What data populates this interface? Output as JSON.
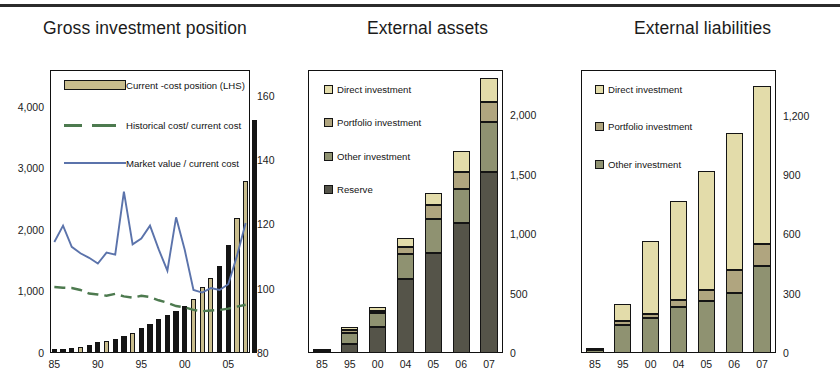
{
  "colors": {
    "direct_investment": "#e3dcaa",
    "portfolio_investment": "#b0a57f",
    "other_investment": "#8f9271",
    "reserve": "#555449",
    "bar_black": "#151515",
    "bar_tan": "#c9bd8d",
    "line_market": "#5b73ab",
    "line_historical": "#4d7a4f",
    "frame": "#111111"
  },
  "panels": [
    {
      "id": "gross-investment-position",
      "title": "Gross investment position"
    },
    {
      "id": "external-assets",
      "title": "External assets"
    },
    {
      "id": "external-liabilities",
      "title": "External liabilities"
    }
  ],
  "chart_data": [
    {
      "type": "bar",
      "id": "gross-investment-position",
      "title": "Gross investment position",
      "xlabel": "",
      "ylabel": "",
      "grid": false,
      "legend_position": "inside-top-left",
      "x": [
        1985,
        1986,
        1987,
        1988,
        1989,
        1990,
        1991,
        1992,
        1993,
        1994,
        1995,
        1996,
        1997,
        1998,
        1999,
        2000,
        2001,
        2002,
        2003,
        2004,
        2005,
        2006,
        2007
      ],
      "tick_labels": [
        "85",
        "90",
        "95",
        "00",
        "05"
      ],
      "tick_values": [
        1985,
        1990,
        1995,
        2000,
        2005
      ],
      "y_left_ticks": [
        "0",
        "1,000",
        "2,000",
        "3,000",
        "4,000"
      ],
      "y_left_tick_values": [
        0,
        1000,
        2000,
        3000,
        4000
      ],
      "ylim_left": [
        0,
        4600
      ],
      "y_right_ticks": [
        "80",
        "100",
        "120",
        "140",
        "160"
      ],
      "y_right_tick_values": [
        80,
        100,
        120,
        140,
        160
      ],
      "ylim_right": [
        80,
        168
      ],
      "series": [
        {
          "name": "Current -cost position (LHS)",
          "type": "bar",
          "axis": "left",
          "values": [
            60,
            70,
            85,
            100,
            130,
            175,
            200,
            235,
            280,
            330,
            400,
            470,
            545,
            620,
            690,
            760,
            870,
            1080,
            1220,
            1420,
            1750,
            2200,
            2800,
            3780
          ],
          "fill_pattern": [
            "black",
            "black",
            "black",
            "tan",
            "black",
            "black",
            "tan",
            "black",
            "black",
            "tan",
            "black",
            "black",
            "black",
            "black",
            "black",
            "black",
            "tan",
            "tan",
            "tan",
            "black",
            "black",
            "tan",
            "tan"
          ]
        },
        {
          "name": "Historical cost/ current cost",
          "type": "line-dashed",
          "axis": "right",
          "values": [
            100.5,
            100.3,
            100.2,
            99.6,
            98.5,
            98.2,
            97.8,
            98.4,
            97.6,
            97.2,
            97.8,
            97.4,
            96.4,
            95.6,
            94.6,
            94.2,
            93.4,
            93.0,
            93.2,
            93.4,
            93.8,
            94.4,
            95.0
          ]
        },
        {
          "name": "Market value / current cost",
          "type": "line",
          "axis": "right",
          "values": [
            114.5,
            119.6,
            113.0,
            111.0,
            109.6,
            107.8,
            111.2,
            110.6,
            130.2,
            113.8,
            115.6,
            119.6,
            112.2,
            105.6,
            122.2,
            112.0,
            99.6,
            98.8,
            100.2,
            99.6,
            101.4,
            110.2,
            120.4
          ]
        }
      ]
    },
    {
      "type": "bar",
      "id": "external-assets",
      "title": "External assets",
      "stacked": true,
      "xlabel": "",
      "ylabel": "",
      "grid": false,
      "legend_position": "inside-top-left",
      "categories": [
        "85",
        "95",
        "00",
        "04",
        "05",
        "06",
        "07"
      ],
      "y_ticks": [
        "0",
        "500",
        "1,000",
        "1,500",
        "2,000"
      ],
      "y_tick_values": [
        0,
        500,
        1000,
        1500,
        2000
      ],
      "ylim": [
        0,
        2380
      ],
      "series": [
        {
          "name": "Reserve",
          "values": [
            8,
            75,
            215,
            620,
            840,
            1090,
            1520
          ]
        },
        {
          "name": "Other investment",
          "values": [
            6,
            95,
            120,
            215,
            285,
            290,
            420
          ]
        },
        {
          "name": "Portfolio investment",
          "values": [
            2,
            20,
            20,
            60,
            120,
            145,
            170
          ]
        },
        {
          "name": "Direct investment",
          "values": [
            2,
            30,
            35,
            75,
            100,
            170,
            200
          ]
        }
      ]
    },
    {
      "type": "bar",
      "id": "external-liabilities",
      "title": "External liabilities",
      "stacked": true,
      "xlabel": "",
      "ylabel": "",
      "grid": false,
      "legend_position": "inside-top-left",
      "categories": [
        "85",
        "95",
        "00",
        "04",
        "05",
        "06",
        "07"
      ],
      "y_ticks": [
        "0",
        "300",
        "600",
        "900",
        "1,200"
      ],
      "y_tick_values": [
        0,
        300,
        600,
        900,
        1200
      ],
      "ylim": [
        0,
        1430
      ],
      "series": [
        {
          "name": "Other investment",
          "values": [
            14,
            140,
            175,
            230,
            265,
            305,
            440
          ]
        },
        {
          "name": "Portfolio investment",
          "values": [
            2,
            22,
            20,
            40,
            55,
            115,
            110
          ]
        },
        {
          "name": "Direct investment",
          "values": [
            4,
            85,
            370,
            500,
            600,
            690,
            800
          ]
        }
      ]
    }
  ]
}
